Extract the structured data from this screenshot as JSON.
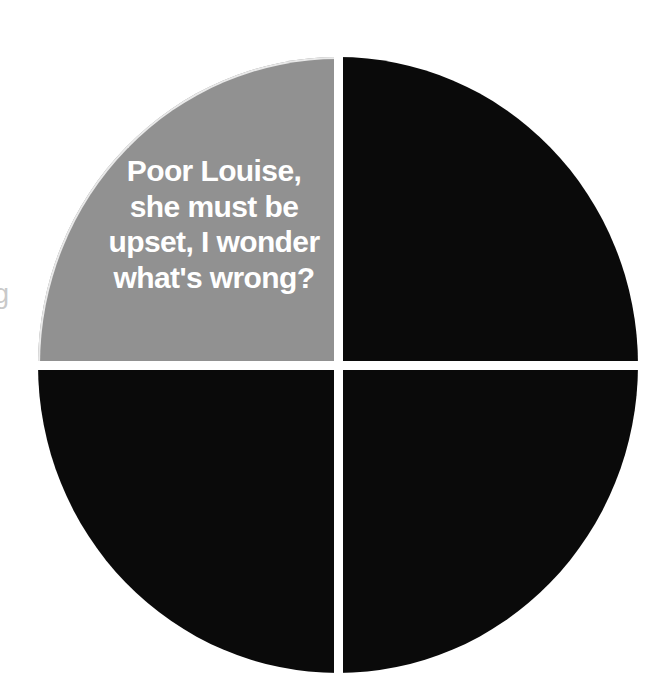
{
  "page": {
    "background_color": "#ffffff",
    "margin_glyph": "g"
  },
  "figure": {
    "name": "quadrant-circle-diagram",
    "shape": "circle",
    "divider_color": "#ffffff",
    "quadrants": [
      {
        "position": "top-left",
        "color": "#919191",
        "label": "Poor Louise,\nshe must be\nupset, I wonder\nwhat's wrong?"
      },
      {
        "position": "top-right",
        "color": "#0a0a0a",
        "label": ""
      },
      {
        "position": "bottom-left",
        "color": "#0a0a0a",
        "label": ""
      },
      {
        "position": "bottom-right",
        "color": "#0a0a0a",
        "label": ""
      }
    ]
  },
  "caption": {
    "text": "Poor Louise,\nshe must be\nupset, I wonder\nwhat's wrong?",
    "color": "#ffffff"
  },
  "chart_data": {
    "type": "pie",
    "title": "",
    "categories": [
      "Top-left (highlighted)",
      "Top-right",
      "Bottom-left",
      "Bottom-right"
    ],
    "values": [
      25,
      25,
      25,
      25
    ],
    "colors": [
      "#919191",
      "#0a0a0a",
      "#0a0a0a",
      "#0a0a0a"
    ],
    "annotations": [
      "Poor Louise, she must be upset, I wonder what's wrong?"
    ],
    "legend": "none",
    "grid": false,
    "xlabel": "",
    "ylabel": ""
  }
}
